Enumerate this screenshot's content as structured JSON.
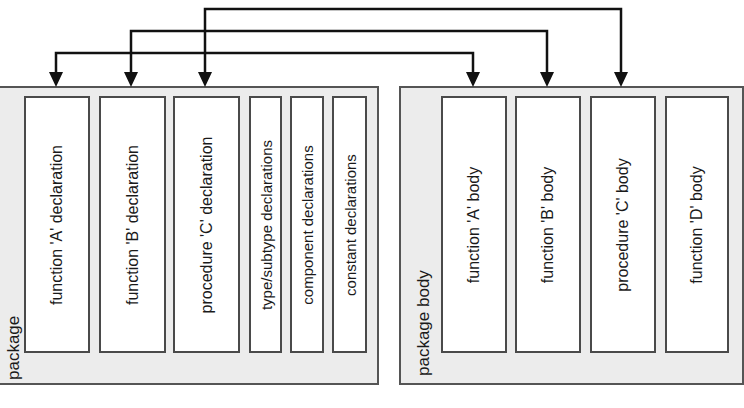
{
  "diagram": {
    "package": {
      "label": "package",
      "boxes": [
        {
          "label": "function 'A' declaration"
        },
        {
          "label": "function 'B' declaration"
        },
        {
          "label": "procedure 'C' declaration"
        },
        {
          "label": "type/subtype declarations"
        },
        {
          "label": "component declarations"
        },
        {
          "label": "constant declarations"
        }
      ]
    },
    "package_body": {
      "label": "package body",
      "boxes": [
        {
          "label": "function 'A' body"
        },
        {
          "label": "function 'B' body"
        },
        {
          "label": "procedure 'C' body"
        },
        {
          "label": "function 'D' body"
        }
      ]
    },
    "connections": [
      {
        "from": "function 'A' declaration",
        "to": "function 'A' body"
      },
      {
        "from": "function 'B' declaration",
        "to": "function 'B' body"
      },
      {
        "from": "procedure 'C' declaration",
        "to": "procedure 'C' body"
      }
    ],
    "colors": {
      "container_fill": "#ececec",
      "container_border": "#555555",
      "box_fill": "#ffffff",
      "line": "#111111"
    }
  }
}
